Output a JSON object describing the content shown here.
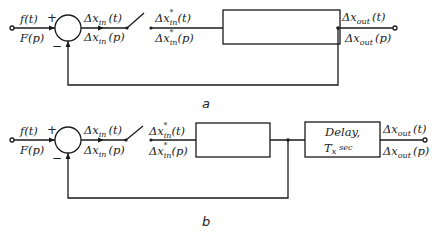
{
  "diagram_a": {
    "caption": "a",
    "input_top": "f(t)",
    "input_bottom": "F(p)",
    "plus_sign": "+",
    "minus_sign": "−",
    "sum_out_top_main": "Δx",
    "sum_out_top_sub": "in",
    "sum_out_top_arg": "(t)",
    "sum_out_bottom_main": "Δx",
    "sum_out_bottom_sub": "in",
    "sum_out_bottom_arg": "(p)",
    "sampled_top_main": "Δx",
    "sampled_top_sub": "in",
    "sampled_top_arg": "(t)",
    "sampled_bottom_main": "Δx",
    "sampled_bottom_sub": "in",
    "sampled_bottom_arg": "(p)",
    "star": "*",
    "output_top_main": "Δx",
    "output_top_sub": "out",
    "output_top_arg": "(t)",
    "output_bottom_main": "Δx",
    "output_bottom_sub": "out",
    "output_bottom_arg": "(p)"
  },
  "diagram_b": {
    "caption": "b",
    "input_top": "f(t)",
    "input_bottom": "F(p)",
    "plus_sign": "+",
    "minus_sign": "−",
    "sum_out_top_main": "Δx",
    "sum_out_top_sub": "in",
    "sum_out_top_arg": "(t)",
    "sum_out_bottom_main": "Δx",
    "sum_out_bottom_sub": "in",
    "sum_out_bottom_arg": "(p)",
    "sampled_top_main": "Δx",
    "sampled_top_sub": "in",
    "sampled_top_arg": "(t)",
    "sampled_bottom_main": "Δx",
    "sampled_bottom_sub": "in",
    "sampled_bottom_arg": "(p)",
    "star": "*",
    "delay_line1": "Delay,",
    "delay_line2_main": "T",
    "delay_line2_sub": "x",
    "delay_line2_unit": "sec",
    "output_top_main": "Δx",
    "output_top_sub": "out",
    "output_top_arg": "(t)",
    "output_bottom_main": "Δx",
    "output_bottom_sub": "out",
    "output_bottom_arg": "(p)"
  }
}
